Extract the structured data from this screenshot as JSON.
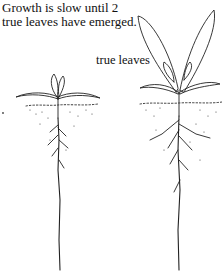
{
  "caption": {
    "line1": "Growth is slow until 2",
    "line2": "true leaves have emerged."
  },
  "labels": {
    "true_leaves": "true leaves"
  },
  "figures": [
    {
      "name": "seedling-early",
      "stage": "cotyledons only"
    },
    {
      "name": "seedling-true-leaves",
      "stage": "2 true leaves emerged"
    }
  ]
}
